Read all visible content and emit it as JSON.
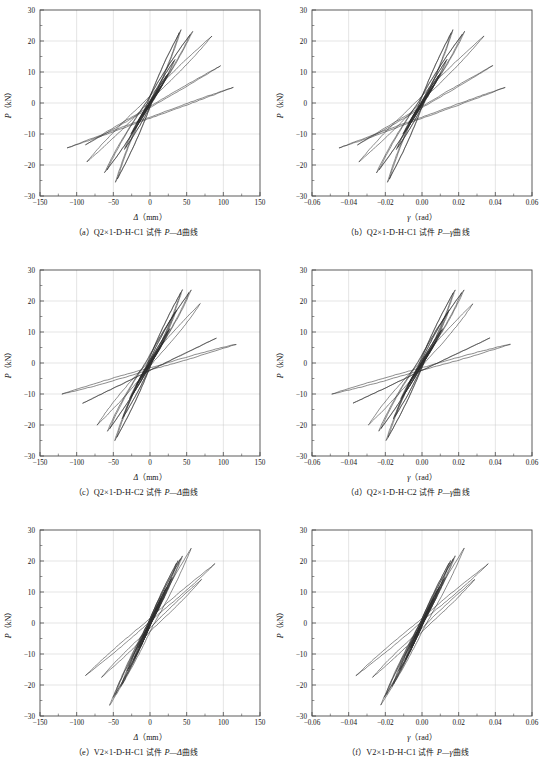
{
  "figure": {
    "panel_count": 6,
    "columns": 2,
    "rows": 3
  },
  "chart_data": [
    {
      "id": "a",
      "type": "line",
      "title": "",
      "caption_index": "（a）",
      "caption_specimen": "Q2×1-D-H-C1",
      "caption_mid": "试件",
      "caption_pair": "P—Δ",
      "caption_tail": "曲线",
      "xlabel": "Δ（mm）",
      "xlabel_sym": "Δ",
      "xlabel_unit": "（mm）",
      "ylabel_sym": "P",
      "ylabel_unit": "（kN）",
      "xlim": [
        -150,
        150
      ],
      "ylim": [
        -30,
        30
      ],
      "xticks": [
        -150,
        -100,
        -50,
        0,
        50,
        100,
        150
      ],
      "xticklabels": [
        "-150",
        "-100",
        "-50",
        "0",
        "50",
        "100",
        "150"
      ],
      "yticks": [
        -30,
        -20,
        -10,
        0,
        10,
        20,
        30
      ],
      "yticklabels": [
        "-30",
        "-20",
        "-10",
        "0",
        "10",
        "20",
        "30"
      ],
      "x_minor_step": 25,
      "y_minor_step": 5,
      "grid": true,
      "legend": "none",
      "description": "Hysteresis loops, pinched S-shape, peak load about 24 kN at 40 mm and about -26 kN at -50 mm, max displacement about 115 mm",
      "peak_positive_force": 24,
      "peak_negative_force": -26,
      "max_positive_disp": 115,
      "max_negative_disp": -113,
      "loops": [
        {
          "ax": 6,
          "ay": 2.0,
          "bx": -6,
          "by": -2.0,
          "w": 1.2,
          "n": 3
        },
        {
          "ax": 11,
          "ay": 4.0,
          "bx": -11,
          "by": -4.2,
          "w": 2.2,
          "n": 3
        },
        {
          "ax": 17,
          "ay": 6.0,
          "bx": -18,
          "by": -6.5,
          "w": 3.4,
          "n": 3
        },
        {
          "ax": 25,
          "ay": 9.5,
          "bx": -26,
          "by": -10.0,
          "w": 5.0,
          "n": 3
        },
        {
          "ax": 34,
          "ay": 14.0,
          "bx": -35,
          "by": -15.0,
          "w": 7.5,
          "n": 2
        },
        {
          "ax": 42,
          "ay": 23.5,
          "bx": -47,
          "by": -25.5,
          "w": 10.0,
          "n": 2
        },
        {
          "ax": 58,
          "ay": 23.0,
          "bx": -62,
          "by": -22.5,
          "w": 13.0,
          "n": 2
        },
        {
          "ax": 84,
          "ay": 21.5,
          "bx": -86,
          "by": -19.0,
          "w": 16.0,
          "n": 1
        },
        {
          "ax": 96,
          "ay": 12.0,
          "bx": -88,
          "by": -13.5,
          "w": 18.0,
          "n": 1
        },
        {
          "ax": 113,
          "ay": 5.0,
          "bx": -113,
          "by": -14.5,
          "w": 20.0,
          "n": 1
        }
      ]
    },
    {
      "id": "b",
      "type": "line",
      "caption_index": "（b）",
      "caption_specimen": "Q2×1-D-H-C1",
      "caption_mid": "试件",
      "caption_pair": "P—γ",
      "caption_tail": "曲线",
      "xlabel": "γ（rad）",
      "xlabel_sym": "γ",
      "xlabel_unit": "（rad）",
      "ylabel_sym": "P",
      "ylabel_unit": "（kN）",
      "xlim": [
        -0.06,
        0.06
      ],
      "ylim": [
        -30,
        30
      ],
      "xticks": [
        -0.06,
        -0.04,
        -0.02,
        0.0,
        0.02,
        0.04,
        0.06
      ],
      "xticklabels": [
        "-0.06",
        "-0.04",
        "-0.02",
        "0.00",
        "0.02",
        "0.04",
        "0.06"
      ],
      "yticks": [
        -30,
        -20,
        -10,
        0,
        10,
        20,
        30
      ],
      "yticklabels": [
        "-30",
        "-20",
        "-10",
        "0",
        "10",
        "20",
        "30"
      ],
      "x_minor_step": 0.01,
      "y_minor_step": 5,
      "grid": true,
      "legend": "none",
      "description": "Same specimen plotted against rotation gamma; peaks near 24 kN at 0.016 rad and -26 kN at -0.022 rad",
      "peak_positive_force": 24,
      "peak_negative_force": -26,
      "max_positive_disp": 0.046,
      "max_negative_disp": -0.047,
      "loops": [
        {
          "ax": 0.0024,
          "ay": 2.0,
          "bx": -0.0024,
          "by": -2.0,
          "w": 0.00048,
          "n": 3
        },
        {
          "ax": 0.0044,
          "ay": 4.0,
          "bx": -0.0044,
          "by": -4.2,
          "w": 0.00088,
          "n": 3
        },
        {
          "ax": 0.0068,
          "ay": 6.0,
          "bx": -0.0072,
          "by": -6.5,
          "w": 0.00136,
          "n": 3
        },
        {
          "ax": 0.01,
          "ay": 9.5,
          "bx": -0.0104,
          "by": -10.0,
          "w": 0.002,
          "n": 3
        },
        {
          "ax": 0.0136,
          "ay": 14.0,
          "bx": -0.014,
          "by": -15.0,
          "w": 0.003,
          "n": 2
        },
        {
          "ax": 0.0168,
          "ay": 23.5,
          "bx": -0.0188,
          "by": -25.5,
          "w": 0.004,
          "n": 2
        },
        {
          "ax": 0.0232,
          "ay": 23.0,
          "bx": -0.0248,
          "by": -22.5,
          "w": 0.0052,
          "n": 2
        },
        {
          "ax": 0.0336,
          "ay": 21.5,
          "bx": -0.0344,
          "by": -19.0,
          "w": 0.0064,
          "n": 1
        },
        {
          "ax": 0.0384,
          "ay": 12.0,
          "bx": -0.0352,
          "by": -13.5,
          "w": 0.0072,
          "n": 1
        },
        {
          "ax": 0.0452,
          "ay": 5.0,
          "bx": -0.0452,
          "by": -14.5,
          "w": 0.008,
          "n": 1
        }
      ]
    },
    {
      "id": "c",
      "type": "line",
      "caption_index": "（c）",
      "caption_specimen": "Q2×1-D-H-C2",
      "caption_mid": "试件",
      "caption_pair": "P—Δ",
      "caption_tail": "曲线",
      "xlabel": "Δ（mm）",
      "xlabel_sym": "Δ",
      "xlabel_unit": "（mm）",
      "ylabel_sym": "P",
      "ylabel_unit": "（kN）",
      "xlim": [
        -150,
        150
      ],
      "ylim": [
        -30,
        30
      ],
      "xticks": [
        -150,
        -100,
        -50,
        0,
        50,
        100,
        150
      ],
      "xticklabels": [
        "-150",
        "-100",
        "-50",
        "0",
        "50",
        "100",
        "150"
      ],
      "yticks": [
        -30,
        -20,
        -10,
        0,
        10,
        20,
        30
      ],
      "yticklabels": [
        "-30",
        "-20",
        "-10",
        "0",
        "10",
        "20",
        "30"
      ],
      "x_minor_step": 25,
      "y_minor_step": 5,
      "grid": true,
      "legend": "none",
      "description": "Hysteresis loops with broader outer loops reaching about 115 mm and -120 mm, peak about 24 kN and -25 kN",
      "peak_positive_force": 24,
      "peak_negative_force": -25,
      "max_positive_disp": 117,
      "max_negative_disp": -120,
      "loops": [
        {
          "ax": 6,
          "ay": 2.2,
          "bx": -6,
          "by": -2.2,
          "w": 1.2,
          "n": 3
        },
        {
          "ax": 12,
          "ay": 4.5,
          "bx": -12,
          "by": -4.6,
          "w": 2.4,
          "n": 3
        },
        {
          "ax": 19,
          "ay": 7.0,
          "bx": -19,
          "by": -7.2,
          "w": 3.8,
          "n": 3
        },
        {
          "ax": 27,
          "ay": 11.0,
          "bx": -28,
          "by": -11.5,
          "w": 5.6,
          "n": 3
        },
        {
          "ax": 36,
          "ay": 17.0,
          "bx": -38,
          "by": -18.0,
          "w": 8.0,
          "n": 2
        },
        {
          "ax": 44,
          "ay": 23.5,
          "bx": -48,
          "by": -25.0,
          "w": 10.5,
          "n": 2
        },
        {
          "ax": 56,
          "ay": 23.5,
          "bx": -58,
          "by": -22.0,
          "w": 13.5,
          "n": 2
        },
        {
          "ax": 68,
          "ay": 19.0,
          "bx": -72,
          "by": -20.0,
          "w": 16.0,
          "n": 1
        },
        {
          "ax": 90,
          "ay": 8.0,
          "bx": -92,
          "by": -13.0,
          "w": 19.0,
          "n": 1
        },
        {
          "ax": 117,
          "ay": 6.0,
          "bx": -120,
          "by": -10.0,
          "w": 21.0,
          "n": 1
        }
      ]
    },
    {
      "id": "d",
      "type": "line",
      "caption_index": "（d）",
      "caption_specimen": "Q2×1-D-H-C2",
      "caption_mid": "试件",
      "caption_pair": "P—γ",
      "caption_tail": "曲线",
      "xlabel": "γ（rad）",
      "xlabel_sym": "γ",
      "xlabel_unit": "（rad）",
      "ylabel_sym": "P",
      "ylabel_unit": "（kN）",
      "xlim": [
        -0.06,
        0.06
      ],
      "ylim": [
        -30,
        30
      ],
      "xticks": [
        -0.06,
        -0.04,
        -0.02,
        0.0,
        0.02,
        0.04,
        0.06
      ],
      "xticklabels": [
        "-0.06",
        "-0.04",
        "-0.02",
        "0.00",
        "0.02",
        "0.04",
        "0.06"
      ],
      "yticks": [
        -30,
        -20,
        -10,
        0,
        10,
        20,
        30
      ],
      "yticklabels": [
        "-30",
        "-20",
        "-10",
        "0",
        "10",
        "20",
        "30"
      ],
      "x_minor_step": 0.01,
      "y_minor_step": 5,
      "grid": true,
      "legend": "none",
      "description": "Specimen C2 rotation plot; outer loops reach about 0.049 rad and -0.050 rad, peaks near 24 kN and -25 kN",
      "peak_positive_force": 24,
      "peak_negative_force": -25,
      "max_positive_disp": 0.049,
      "max_negative_disp": -0.05,
      "loops": [
        {
          "ax": 0.0024,
          "ay": 2.2,
          "bx": -0.0024,
          "by": -2.2,
          "w": 0.0005,
          "n": 3
        },
        {
          "ax": 0.005,
          "ay": 4.5,
          "bx": -0.005,
          "by": -4.6,
          "w": 0.001,
          "n": 3
        },
        {
          "ax": 0.0078,
          "ay": 7.0,
          "bx": -0.0078,
          "by": -7.2,
          "w": 0.0016,
          "n": 3
        },
        {
          "ax": 0.0112,
          "ay": 11.0,
          "bx": -0.0116,
          "by": -11.5,
          "w": 0.0023,
          "n": 3
        },
        {
          "ax": 0.0148,
          "ay": 17.0,
          "bx": -0.0156,
          "by": -18.0,
          "w": 0.0033,
          "n": 2
        },
        {
          "ax": 0.018,
          "ay": 23.5,
          "bx": -0.0196,
          "by": -25.0,
          "w": 0.0043,
          "n": 2
        },
        {
          "ax": 0.0228,
          "ay": 23.5,
          "bx": -0.0236,
          "by": -22.0,
          "w": 0.0055,
          "n": 2
        },
        {
          "ax": 0.0276,
          "ay": 19.0,
          "bx": -0.0292,
          "by": -20.0,
          "w": 0.0066,
          "n": 1
        },
        {
          "ax": 0.0368,
          "ay": 8.0,
          "bx": -0.0376,
          "by": -13.0,
          "w": 0.0078,
          "n": 1
        },
        {
          "ax": 0.048,
          "ay": 6.0,
          "bx": -0.0492,
          "by": -10.0,
          "w": 0.0086,
          "n": 1
        }
      ]
    },
    {
      "id": "e",
      "type": "line",
      "caption_index": "（e）",
      "caption_specimen": "V2×1-D-H-C1",
      "caption_mid": "试件",
      "caption_pair": "P—Δ",
      "caption_tail": "曲线",
      "xlabel": "Δ（mm）",
      "xlabel_sym": "Δ",
      "xlabel_unit": "（mm）",
      "ylabel_sym": "P",
      "ylabel_unit": "（kN）",
      "xlim": [
        -150,
        150
      ],
      "ylim": [
        -30,
        30
      ],
      "xticks": [
        -150,
        -100,
        -50,
        0,
        50,
        100,
        150
      ],
      "xticklabels": [
        "-150",
        "-100",
        "-50",
        "0",
        "50",
        "100",
        "150"
      ],
      "yticks": [
        -30,
        -20,
        -10,
        0,
        10,
        20,
        30
      ],
      "yticklabels": [
        "-30",
        "-20",
        "-10",
        "0",
        "10",
        "20",
        "30"
      ],
      "x_minor_step": 25,
      "y_minor_step": 5,
      "grid": true,
      "legend": "none",
      "description": "Narrower steeper hysteresis loops confined within about -90 to 90 mm, peak about 24 kN at 56 mm and -26 kN at -54 mm",
      "peak_positive_force": 24,
      "peak_negative_force": -26,
      "max_positive_disp": 88,
      "max_negative_disp": -88,
      "loops": [
        {
          "ax": 5,
          "ay": 2.5,
          "bx": -5,
          "by": -2.5,
          "w": 0.9,
          "n": 3
        },
        {
          "ax": 10,
          "ay": 5.0,
          "bx": -10,
          "by": -5.0,
          "w": 1.8,
          "n": 3
        },
        {
          "ax": 16,
          "ay": 8.0,
          "bx": -16,
          "by": -8.2,
          "w": 2.8,
          "n": 3
        },
        {
          "ax": 23,
          "ay": 11.5,
          "bx": -23,
          "by": -12.0,
          "w": 4.0,
          "n": 3
        },
        {
          "ax": 30,
          "ay": 14.5,
          "bx": -31,
          "by": -15.5,
          "w": 5.5,
          "n": 2
        },
        {
          "ax": 38,
          "ay": 20.0,
          "bx": -40,
          "by": -20.5,
          "w": 7.0,
          "n": 2
        },
        {
          "ax": 44,
          "ay": 21.5,
          "bx": -50,
          "by": -24.0,
          "w": 8.5,
          "n": 2
        },
        {
          "ax": 56,
          "ay": 24.0,
          "bx": -55,
          "by": -26.5,
          "w": 10.0,
          "n": 1
        },
        {
          "ax": 70,
          "ay": 14.0,
          "bx": -66,
          "by": -17.5,
          "w": 12.0,
          "n": 1
        },
        {
          "ax": 88,
          "ay": 19.0,
          "bx": -88,
          "by": -17.0,
          "w": 14.0,
          "n": 1
        }
      ]
    },
    {
      "id": "f",
      "type": "line",
      "caption_index": "（f）",
      "caption_specimen": "V2×1-D-H-C1",
      "caption_mid": "试件",
      "caption_pair": "P—γ",
      "caption_tail": "曲线",
      "xlabel": "γ（rad）",
      "xlabel_sym": "γ",
      "xlabel_unit": "（rad）",
      "ylabel_sym": "P",
      "ylabel_unit": "（kN）",
      "xlim": [
        -0.06,
        0.06
      ],
      "ylim": [
        -30,
        30
      ],
      "xticks": [
        -0.06,
        -0.04,
        -0.02,
        0.0,
        0.02,
        0.04,
        0.06
      ],
      "xticklabels": [
        "-0.06",
        "-0.04",
        "-0.02",
        "0.00",
        "0.02",
        "0.04",
        "0.06"
      ],
      "yticks": [
        -30,
        -20,
        -10,
        0,
        10,
        20,
        30
      ],
      "yticklabels": [
        "-30",
        "-20",
        "-10",
        "0",
        "10",
        "20",
        "30"
      ],
      "x_minor_step": 0.01,
      "y_minor_step": 5,
      "grid": true,
      "legend": "none",
      "description": "Narrow steep loops within about -0.036 to 0.036 rad, peak near 24 kN at 0.023 rad and -26 kN at -0.022 rad",
      "peak_positive_force": 24,
      "peak_negative_force": -26,
      "max_positive_disp": 0.036,
      "max_negative_disp": -0.036,
      "loops": [
        {
          "ax": 0.002,
          "ay": 2.5,
          "bx": -0.002,
          "by": -2.5,
          "w": 0.00037,
          "n": 3
        },
        {
          "ax": 0.0041,
          "ay": 5.0,
          "bx": -0.0041,
          "by": -5.0,
          "w": 0.00074,
          "n": 3
        },
        {
          "ax": 0.0065,
          "ay": 8.0,
          "bx": -0.0065,
          "by": -8.2,
          "w": 0.00115,
          "n": 3
        },
        {
          "ax": 0.0094,
          "ay": 11.5,
          "bx": -0.0094,
          "by": -12.0,
          "w": 0.00164,
          "n": 3
        },
        {
          "ax": 0.0123,
          "ay": 14.5,
          "bx": -0.0127,
          "by": -15.5,
          "w": 0.00225,
          "n": 2
        },
        {
          "ax": 0.0155,
          "ay": 20.0,
          "bx": -0.0164,
          "by": -20.5,
          "w": 0.00287,
          "n": 2
        },
        {
          "ax": 0.018,
          "ay": 21.5,
          "bx": -0.0205,
          "by": -24.0,
          "w": 0.00348,
          "n": 2
        },
        {
          "ax": 0.0229,
          "ay": 24.0,
          "bx": -0.0225,
          "by": -26.5,
          "w": 0.0041,
          "n": 1
        },
        {
          "ax": 0.0287,
          "ay": 14.0,
          "bx": -0.027,
          "by": -17.5,
          "w": 0.0049,
          "n": 1
        },
        {
          "ax": 0.036,
          "ay": 19.0,
          "bx": -0.036,
          "by": -17.0,
          "w": 0.0057,
          "n": 1
        }
      ]
    }
  ]
}
